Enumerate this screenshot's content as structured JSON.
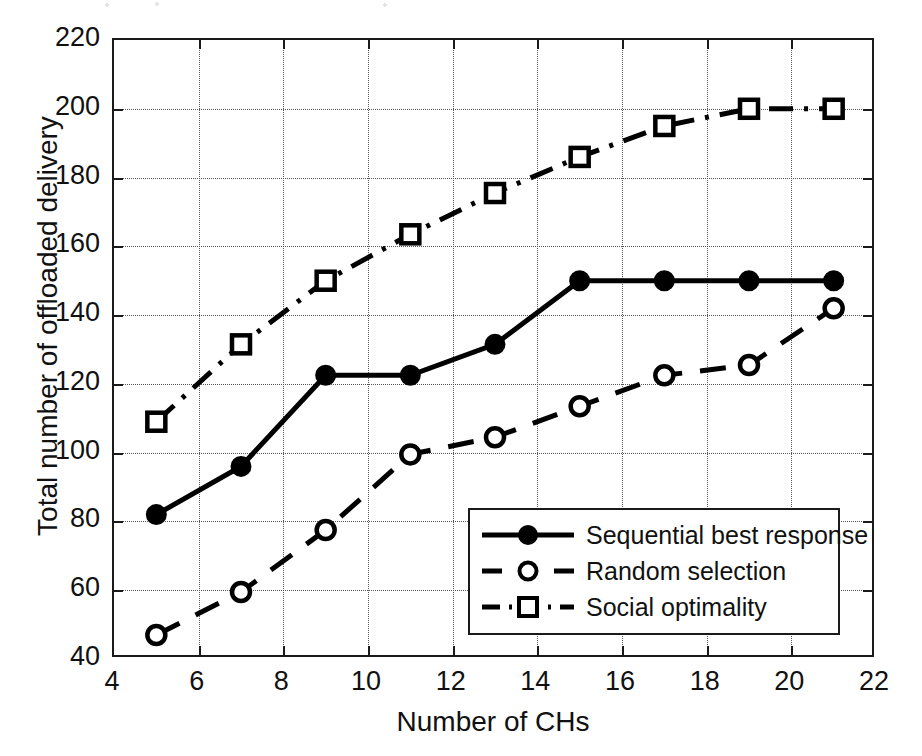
{
  "chart_data": {
    "type": "line",
    "title": "",
    "xlabel": "Number of CHs",
    "ylabel": "Total number of offloaded delivery",
    "x": [
      5,
      7,
      9,
      11,
      13,
      15,
      17,
      19,
      21
    ],
    "xlim": [
      4,
      22
    ],
    "ylim": [
      40,
      220
    ],
    "xticks": [
      4,
      6,
      8,
      10,
      12,
      14,
      16,
      18,
      20,
      22
    ],
    "yticks": [
      40,
      60,
      80,
      100,
      120,
      140,
      160,
      180,
      200,
      220
    ],
    "grid": true,
    "legend_position": "lower right inside",
    "series": [
      {
        "name": "Sequential best response",
        "values": [
          82,
          96,
          122.5,
          122.5,
          131.5,
          150,
          150,
          150,
          150
        ],
        "linestyle": "solid",
        "marker": "filled-circle",
        "color": "#000000"
      },
      {
        "name": "Random selection",
        "values": [
          47,
          59.5,
          77.5,
          99.5,
          104.5,
          113.5,
          122.5,
          125.5,
          142
        ],
        "linestyle": "dashed",
        "marker": "open-circle",
        "color": "#000000"
      },
      {
        "name": "Social optimality",
        "values": [
          109,
          131.5,
          150,
          163.5,
          175.5,
          186,
          195,
          200,
          200
        ],
        "linestyle": "dash-dot",
        "marker": "open-square",
        "color": "#000000"
      }
    ]
  },
  "legend": {
    "items": [
      {
        "label": "Sequential best response",
        "icon": "solid-line-filled-circle-icon"
      },
      {
        "label": "Random selection",
        "icon": "dashed-line-open-circle-icon"
      },
      {
        "label": "Social optimality",
        "icon": "dashdot-line-open-square-icon"
      }
    ]
  },
  "colors": {
    "axis": "#1a1a1a",
    "grid": "#555555",
    "series": "#000000",
    "background": "#ffffff"
  }
}
